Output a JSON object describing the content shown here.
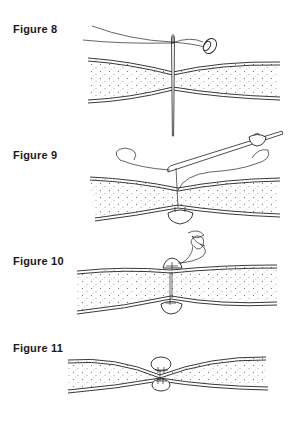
{
  "figures": [
    {
      "id": "fig8",
      "label": "Figure 8",
      "label_pos": [
        13,
        23
      ],
      "description": "Needle with thread and button pierces through folded fabric layers"
    },
    {
      "id": "fig9",
      "label": "Figure 9",
      "label_pos": [
        13,
        149
      ],
      "description": "Needle exits at top; button positioned below fabric with thread loops"
    },
    {
      "id": "fig10",
      "label": "Figure 10",
      "label_pos": [
        13,
        255
      ],
      "description": "Buttons on both sides of fabric joined with thread; spiral thread tail above"
    },
    {
      "id": "fig11",
      "label": "Figure 11",
      "label_pos": [
        13,
        342
      ],
      "description": "Finished tuft: two buttons pinching fabric together at center"
    }
  ],
  "colors": {
    "ink": "#222222",
    "background": "#ffffff",
    "stipple": "#444444"
  }
}
